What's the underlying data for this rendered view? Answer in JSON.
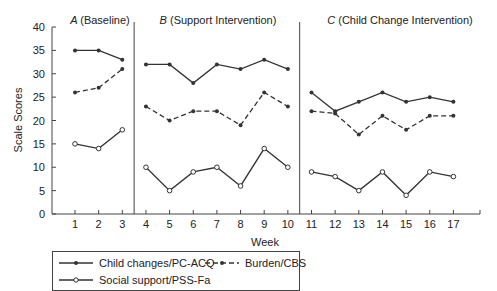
{
  "chart_data": {
    "type": "line",
    "title": "",
    "xlabel": "Week",
    "ylabel": "Scale Scores",
    "ylim": [
      0,
      40
    ],
    "yticks": [
      0,
      5,
      10,
      15,
      20,
      25,
      30,
      35,
      40
    ],
    "x": [
      1,
      2,
      3,
      4,
      5,
      6,
      7,
      8,
      9,
      10,
      11,
      12,
      13,
      14,
      15,
      16,
      17
    ],
    "grid": false,
    "legend_position": "bottom-left, below axis",
    "phases": [
      {
        "letter": "A",
        "label": "(Baseline)",
        "weeks": [
          1,
          3
        ]
      },
      {
        "letter": "B",
        "label": "(Support Intervention)",
        "weeks": [
          4,
          10
        ]
      },
      {
        "letter": "C",
        "label": "(Child Change Intervention)",
        "weeks": [
          11,
          17
        ]
      }
    ],
    "series": [
      {
        "name": "Child changes/PC-ACQ",
        "style": "solid line, filled dot markers",
        "values": [
          35,
          35,
          33,
          32,
          32,
          28,
          32,
          31,
          33,
          31,
          26,
          22,
          24,
          26,
          24,
          25,
          24
        ]
      },
      {
        "name": "Burden/CBS",
        "style": "dashed line, filled dot markers",
        "values": [
          26,
          27,
          31,
          23,
          20,
          22,
          22,
          19,
          26,
          23,
          22,
          21.5,
          17,
          21,
          18,
          21,
          21
        ]
      },
      {
        "name": "Social support/PSS-Fa",
        "style": "solid line, open circle markers",
        "values": [
          15,
          14,
          18,
          10,
          5,
          9,
          10,
          6,
          14,
          10,
          9,
          8,
          5,
          9,
          4,
          9,
          8
        ]
      }
    ]
  },
  "legend": {
    "items": [
      {
        "label": "Child changes/PC-ACQ"
      },
      {
        "label": "Burden/CBS"
      },
      {
        "label": "Social support/PSS-Fa"
      }
    ]
  },
  "colors": {
    "line": "#333333",
    "axis": "#444444"
  }
}
